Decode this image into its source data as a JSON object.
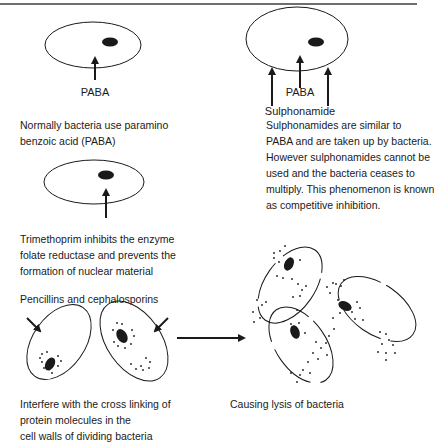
{
  "panels": {
    "normal": {
      "label": "PABA",
      "caption": [
        "Normally bacteria use paramino",
        "benzoic acid (PABA)"
      ]
    },
    "sulphonamide": {
      "label_top": "PABA",
      "label_bottom": "Sulphonamide",
      "caption": [
        "Sulphonamides are similar to",
        "PABA and are taken up by bacteria.",
        "However sulphonamides cannot be",
        "used and the bacteria ceases to",
        "multiply. This phenomenon is known",
        "as competitive inhibition."
      ]
    },
    "trimethoprim": {
      "caption": [
        "Trimethoprim inhibits the enzyme",
        "folate reductase and prevents the",
        "formation of nuclear material"
      ]
    },
    "penicillin": {
      "heading": "Pencillins and cephalosporins",
      "caption": [
        "Interfere with the cross linking of",
        "protein molecules in the",
        "cell walls of dividing bacteria"
      ]
    },
    "lysis": {
      "caption": "Causing lysis of bacteria"
    }
  },
  "colors": {
    "ink": "#1a1a1a",
    "rule": "#6e6e6e",
    "background": "#ffffff"
  }
}
